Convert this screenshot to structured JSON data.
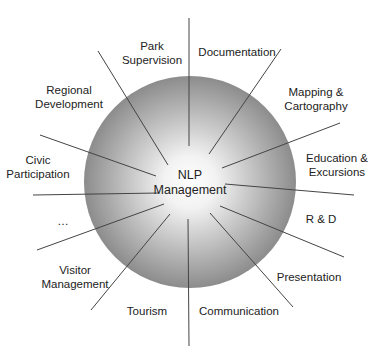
{
  "diagram": {
    "center": {
      "label_line1": "NLP",
      "label_line2": "Management"
    },
    "colors": {
      "circle_center": "#ffffff",
      "circle_edge": "#8c8c8c",
      "line": "#444444",
      "text": "#222222"
    },
    "branches": [
      {
        "id": "park-supervision",
        "line1": "Park",
        "line2": "Supervision",
        "x": 152,
        "y": 53
      },
      {
        "id": "documentation",
        "line1": "Documentation",
        "line2": "",
        "x": 237,
        "y": 52
      },
      {
        "id": "mapping-cartography",
        "line1": "Mapping &",
        "line2": "Cartography",
        "x": 316,
        "y": 99
      },
      {
        "id": "education-excursions",
        "line1": "Education &",
        "line2": "Excursions",
        "x": 337,
        "y": 165
      },
      {
        "id": "r-and-d",
        "line1": "R & D",
        "line2": "",
        "x": 321,
        "y": 219
      },
      {
        "id": "presentation",
        "line1": "Presentation",
        "line2": "",
        "x": 309,
        "y": 277
      },
      {
        "id": "communication",
        "line1": "Communication",
        "line2": "",
        "x": 239,
        "y": 311
      },
      {
        "id": "tourism",
        "line1": "Tourism",
        "line2": "",
        "x": 147,
        "y": 311
      },
      {
        "id": "visitor-management",
        "line1": "Visitor",
        "line2": "Management",
        "x": 75,
        "y": 277
      },
      {
        "id": "more",
        "line1": "…",
        "line2": "",
        "x": 63,
        "y": 221
      },
      {
        "id": "civic-participation",
        "line1": "Civic",
        "line2": "Participation",
        "x": 38,
        "y": 167
      },
      {
        "id": "regional-development",
        "line1": "Regional",
        "line2": "Development",
        "x": 69,
        "y": 97
      }
    ],
    "lines": [
      {
        "x1": 189,
        "y1": 18,
        "x2": 189,
        "y2": 146
      },
      {
        "x1": 281,
        "y1": 49,
        "x2": 209,
        "y2": 154
      },
      {
        "x1": 340,
        "y1": 123,
        "x2": 222,
        "y2": 168
      },
      {
        "x1": 225,
        "y1": 184,
        "x2": 354,
        "y2": 195
      },
      {
        "x1": 220,
        "y1": 206,
        "x2": 344,
        "y2": 257
      },
      {
        "x1": 210,
        "y1": 213,
        "x2": 293,
        "y2": 307
      },
      {
        "x1": 188,
        "y1": 219,
        "x2": 189,
        "y2": 346
      },
      {
        "x1": 170,
        "y1": 214,
        "x2": 91,
        "y2": 310
      },
      {
        "x1": 164,
        "y1": 204,
        "x2": 37,
        "y2": 250
      },
      {
        "x1": 159,
        "y1": 193,
        "x2": 33,
        "y2": 195
      },
      {
        "x1": 156,
        "y1": 176,
        "x2": 40,
        "y2": 135
      },
      {
        "x1": 168,
        "y1": 165,
        "x2": 98,
        "y2": 51
      }
    ],
    "circle": {
      "cx": 190,
      "cy": 182,
      "r": 106
    }
  }
}
